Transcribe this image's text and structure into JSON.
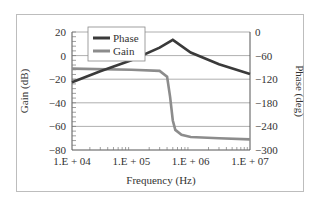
{
  "chart_data": {
    "type": "line",
    "title": "",
    "xlabel": "Frequency (Hz)",
    "ylabel": "Gain (dB)",
    "ylabel_right": "Phase (deg)",
    "x_scale": "log",
    "xlim": [
      10000,
      10000000
    ],
    "ylim": [
      -80,
      20
    ],
    "ylim_right": [
      -300,
      0
    ],
    "x_ticks": [
      "1.E + 04",
      "1.E + 05",
      "1.E + 06",
      "1.E + 07"
    ],
    "y_ticks_left": [
      "20",
      "0",
      "−20",
      "−40",
      "−60",
      "−80"
    ],
    "y_ticks_right": [
      "0",
      "−60",
      "−120",
      "−180",
      "−240",
      "−300"
    ],
    "grid": "horizontal",
    "legend_position": "upper-left",
    "series": [
      {
        "name": "Phase",
        "axis": "right",
        "color": "#3a3a3a",
        "x": [
          10000,
          30000,
          100000,
          300000,
          500000,
          1000000,
          3000000,
          10000000
        ],
        "values": [
          -128,
          -100,
          -72,
          -40,
          -20,
          -52,
          -82,
          -107
        ]
      },
      {
        "name": "Gain",
        "axis": "left",
        "color": "#8c8c8c",
        "x": [
          10000,
          100000,
          300000,
          400000,
          450000,
          500000,
          550000,
          700000,
          1000000,
          3000000,
          10000000
        ],
        "values": [
          -11,
          -12,
          -13,
          -18,
          -35,
          -55,
          -63,
          -67,
          -69,
          -70,
          -71
        ]
      }
    ]
  }
}
